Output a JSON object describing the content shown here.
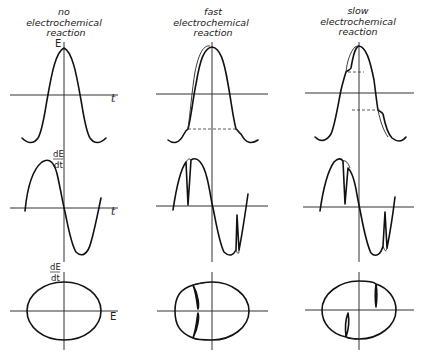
{
  "columns": [
    {
      "title_lines": [
        "no",
        "electrochemical",
        "reaction"
      ]
    },
    {
      "title_lines": [
        "fast",
        "electrochemical",
        "reaction"
      ]
    },
    {
      "title_lines": [
        "slow",
        "electrochemical",
        "reaction"
      ]
    }
  ],
  "axis_labels": {
    "E": "E",
    "t": "t",
    "dEdt_num": "dE",
    "dEdt_den": "dt"
  },
  "rows": [
    {
      "name": "potential-vs-time",
      "y_label": "E",
      "x_label": "t"
    },
    {
      "name": "derivative-vs-time",
      "y_label": "dE/dt",
      "x_label": "t"
    },
    {
      "name": "derivative-vs-potential",
      "y_label": "dE/dt",
      "x_label": "E"
    }
  ],
  "colors": {
    "ink": "#111111",
    "background": "#ffffff"
  }
}
